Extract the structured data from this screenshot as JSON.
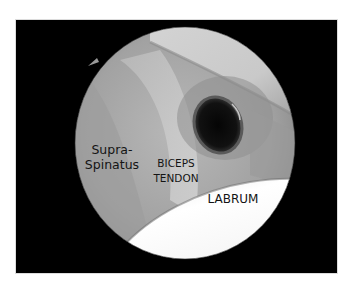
{
  "figure": {
    "type": "arthroscopic-view",
    "frame_color": "#000000",
    "labels": {
      "supraspinatus_line1": "Supra-",
      "supraspinatus_line2": "Spinatus",
      "biceps_line1": "BICEPS",
      "biceps_line2": "TENDON",
      "labrum": "LABRUM"
    }
  }
}
